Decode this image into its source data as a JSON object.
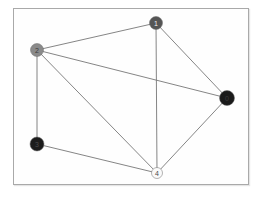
{
  "figure": {
    "title": "",
    "background_color": "#ffffff",
    "frame": {
      "border_color": "#a9a9a9",
      "fill_color": "#fefefe",
      "x": 13,
      "y": 8,
      "width": 236,
      "height": 177
    }
  },
  "chart_data": {
    "type": "diagram",
    "graph_type": "undirected-node-link-graph",
    "title": "",
    "xlabel": "",
    "ylabel": "",
    "grid": false,
    "legend": "none",
    "axis_visible": false,
    "node_count": 5,
    "edge_count": 8,
    "nodes": [
      {
        "id": "0",
        "label": "0",
        "x": 227,
        "y": 98,
        "radius": 7.5,
        "color": "#1a1a1a",
        "label_color": "#3a3a3a"
      },
      {
        "id": "1",
        "label": "1",
        "x": 156,
        "y": 23,
        "radius": 6.5,
        "color": "#555555",
        "label_color": "#f0f0f0"
      },
      {
        "id": "2",
        "label": "2",
        "x": 37,
        "y": 50,
        "radius": 6.5,
        "color": "#8a8a8a",
        "label_color": "#3a3a3a"
      },
      {
        "id": "3",
        "label": "3",
        "x": 37,
        "y": 144,
        "radius": 7.0,
        "color": "#1c1c1c",
        "label_color": "#4a4a4a"
      },
      {
        "id": "4",
        "label": "4",
        "x": 157,
        "y": 173,
        "radius": 5.5,
        "color": "#fafafa",
        "label_color": "#4a4a4a"
      }
    ],
    "edges": [
      {
        "source": "2",
        "target": "1",
        "color": "#777777"
      },
      {
        "source": "2",
        "target": "0",
        "color": "#777777"
      },
      {
        "source": "2",
        "target": "4",
        "color": "#777777"
      },
      {
        "source": "2",
        "target": "3",
        "color": "#777777"
      },
      {
        "source": "1",
        "target": "0",
        "color": "#777777"
      },
      {
        "source": "1",
        "target": "4",
        "color": "#777777"
      },
      {
        "source": "0",
        "target": "4",
        "color": "#777777"
      },
      {
        "source": "3",
        "target": "4",
        "color": "#777777"
      }
    ]
  }
}
